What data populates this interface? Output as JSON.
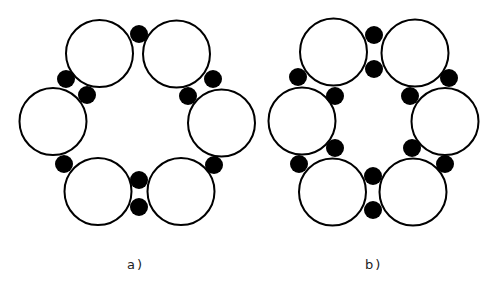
{
  "style": {
    "ring_stroke": "#000000",
    "ring_fill": "#ffffff",
    "ring_stroke_width": 2,
    "dot_fill": "#000000",
    "label_color": "#222222"
  },
  "diagrams": [
    {
      "id": "a",
      "label": "a)",
      "label_pos": {
        "x": 127,
        "y": 257
      },
      "ring_radius": 33.5,
      "rings": [
        {
          "cx": 99.5,
          "cy": 53.5
        },
        {
          "cx": 176.5,
          "cy": 54
        },
        {
          "cx": 221.5,
          "cy": 123
        },
        {
          "cx": 181,
          "cy": 191.5
        },
        {
          "cx": 98,
          "cy": 191.5
        },
        {
          "cx": 53,
          "cy": 121.5
        }
      ],
      "dot_radius": 9,
      "dots": [
        {
          "cx": 139,
          "cy": 34
        },
        {
          "cx": 213,
          "cy": 79
        },
        {
          "cx": 188,
          "cy": 96
        },
        {
          "cx": 214,
          "cy": 165
        },
        {
          "cx": 139,
          "cy": 180
        },
        {
          "cx": 139,
          "cy": 207
        },
        {
          "cx": 64,
          "cy": 164
        },
        {
          "cx": 66,
          "cy": 79
        },
        {
          "cx": 87,
          "cy": 95
        }
      ]
    },
    {
      "id": "b",
      "label": "b)",
      "label_pos": {
        "x": 365,
        "y": 257
      },
      "ring_radius": 33.5,
      "rings": [
        {
          "cx": 333.5,
          "cy": 52
        },
        {
          "cx": 415,
          "cy": 53
        },
        {
          "cx": 445,
          "cy": 121.5
        },
        {
          "cx": 413,
          "cy": 192
        },
        {
          "cx": 332.5,
          "cy": 192
        },
        {
          "cx": 302,
          "cy": 121
        }
      ],
      "dot_radius": 9,
      "dots": [
        {
          "cx": 374,
          "cy": 35
        },
        {
          "cx": 374,
          "cy": 69
        },
        {
          "cx": 449,
          "cy": 78
        },
        {
          "cx": 410,
          "cy": 96
        },
        {
          "cx": 412,
          "cy": 148
        },
        {
          "cx": 445,
          "cy": 164
        },
        {
          "cx": 373,
          "cy": 176
        },
        {
          "cx": 373,
          "cy": 210
        },
        {
          "cx": 299,
          "cy": 164
        },
        {
          "cx": 335,
          "cy": 148
        },
        {
          "cx": 298,
          "cy": 77
        },
        {
          "cx": 335,
          "cy": 96
        }
      ]
    }
  ]
}
